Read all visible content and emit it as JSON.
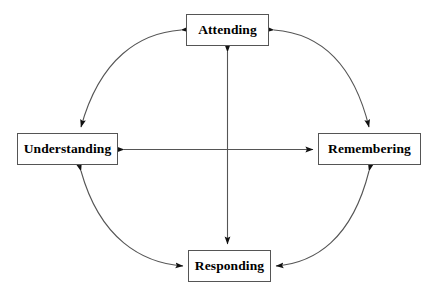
{
  "diagram": {
    "type": "cycle-diagram",
    "stroke_color": "#555555",
    "text_color": "#000000",
    "background_color": "#ffffff",
    "nodes": [
      {
        "id": "attending",
        "label": "Attending",
        "position": "top"
      },
      {
        "id": "understanding",
        "label": "Understanding",
        "position": "left"
      },
      {
        "id": "remembering",
        "label": "Remembering",
        "position": "right"
      },
      {
        "id": "responding",
        "label": "Responding",
        "position": "bottom"
      }
    ],
    "connectors": [
      {
        "id": "arc-attending-understanding",
        "from": "attending",
        "to": "understanding",
        "shape": "arc",
        "arrowheads": "both"
      },
      {
        "id": "arc-attending-remembering",
        "from": "attending",
        "to": "remembering",
        "shape": "arc",
        "arrowheads": "both"
      },
      {
        "id": "arc-understanding-responding",
        "from": "understanding",
        "to": "responding",
        "shape": "arc",
        "arrowheads": "both"
      },
      {
        "id": "arc-remembering-responding",
        "from": "remembering",
        "to": "responding",
        "shape": "arc",
        "arrowheads": "both"
      },
      {
        "id": "line-understanding-remembering",
        "from": "understanding",
        "to": "remembering",
        "shape": "straight",
        "arrowheads": "both"
      },
      {
        "id": "line-attending-responding",
        "from": "attending",
        "to": "responding",
        "shape": "straight",
        "arrowheads": "both"
      }
    ]
  }
}
